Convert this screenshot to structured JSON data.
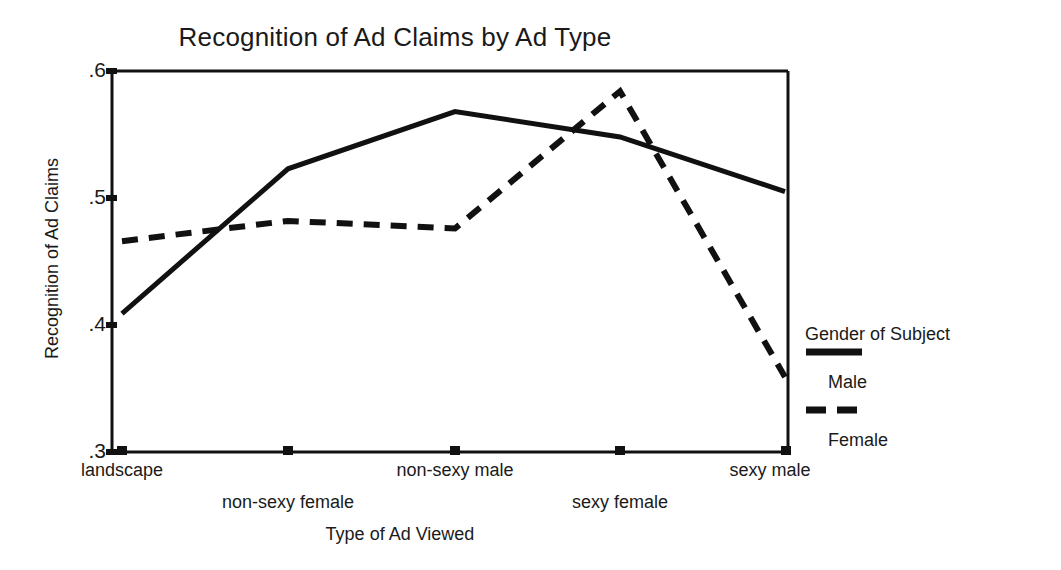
{
  "chart_data": {
    "type": "line",
    "title": "Recognition of Ad Claims by Ad Type",
    "xlabel": "Type of Ad Viewed",
    "ylabel": "Recognition of Ad Claims",
    "categories": [
      "landscape",
      "non-sexy female",
      "non-sexy male",
      "sexy female",
      "sexy male"
    ],
    "ylim": [
      0.3,
      0.6
    ],
    "yticks": [
      0.3,
      0.4,
      0.5,
      0.6
    ],
    "ytick_labels": [
      ".3",
      ".4",
      ".5",
      ".6"
    ],
    "grid": false,
    "legend_position": "right",
    "legend_title": "Gender of Subject",
    "series": [
      {
        "name": "Male",
        "style": "solid",
        "color": "#111111",
        "values": [
          0.409,
          0.523,
          0.568,
          0.548,
          0.505
        ]
      },
      {
        "name": "Female",
        "style": "dashed",
        "color": "#111111",
        "values": [
          0.466,
          0.482,
          0.476,
          0.584,
          0.359
        ]
      }
    ]
  },
  "axes": {
    "y_tick_0": ".6",
    "y_tick_1": ".5",
    "y_tick_2": ".4",
    "y_tick_3": ".3"
  },
  "x_labels": {
    "l0": "landscape",
    "l1": "non-sexy female",
    "l2": "non-sexy male",
    "l3": "sexy female",
    "l4": "sexy male"
  },
  "legend": {
    "title": "Gender of Subject",
    "male": "Male",
    "female": "Female"
  }
}
